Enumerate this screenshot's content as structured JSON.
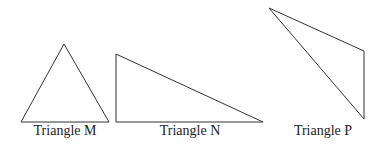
{
  "figure": {
    "stroke_color": "#333333",
    "triangles": [
      {
        "id": "M",
        "label": "Triangle M",
        "points": [
          [
            64,
            44
          ],
          [
            21,
            122
          ],
          [
            109,
            122
          ]
        ],
        "label_pos": [
          65,
          124
        ]
      },
      {
        "id": "N",
        "label": "Triangle N",
        "points": [
          [
            116,
            54
          ],
          [
            116,
            122
          ],
          [
            263,
            122
          ]
        ],
        "label_pos": [
          190,
          124
        ]
      },
      {
        "id": "P",
        "label": "Triangle P",
        "points": [
          [
            269,
            8
          ],
          [
            364,
            51
          ],
          [
            364,
            119
          ]
        ],
        "label_pos": [
          323,
          124
        ]
      }
    ]
  }
}
